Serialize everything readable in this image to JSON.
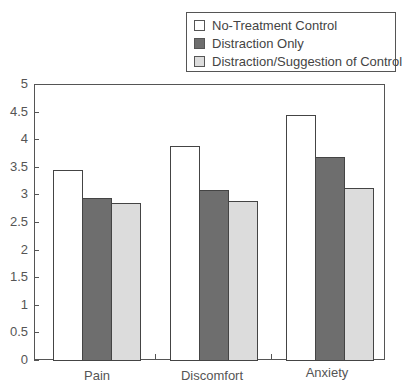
{
  "chart_data": {
    "type": "bar",
    "title": "",
    "xlabel": "",
    "ylabel": "",
    "ylim": [
      0,
      5
    ],
    "yticks": [
      "0",
      "0.5",
      "1",
      "1.5",
      "2",
      "2.5",
      "3",
      "3.5",
      "4",
      "4.5",
      "5"
    ],
    "categories": [
      "Pain",
      "Discomfort",
      "Anxiety"
    ],
    "series": [
      {
        "name": "No-Treatment Control",
        "color": "#ffffff",
        "values": [
          3.44,
          3.88,
          4.44
        ]
      },
      {
        "name": "Distraction Only",
        "color": "#6e6e6e",
        "values": [
          2.93,
          3.08,
          3.68
        ]
      },
      {
        "name": "Distraction/Suggestion of Control",
        "color": "#dcdcdc",
        "values": [
          2.84,
          2.88,
          3.12
        ]
      }
    ],
    "grid": false,
    "legend_position": "top-right"
  },
  "legend": {
    "items": [
      {
        "label": "No-Treatment Control",
        "color": "#ffffff"
      },
      {
        "label": "Distraction Only",
        "color": "#6e6e6e"
      },
      {
        "label": "Distraction/Suggestion of Control",
        "color": "#dcdcdc"
      }
    ]
  }
}
